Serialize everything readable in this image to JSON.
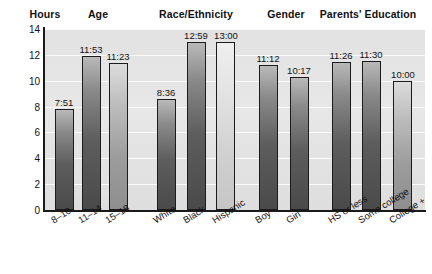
{
  "chart_data": {
    "type": "bar",
    "title": "",
    "xlabel": "",
    "ylabel": "Hours",
    "ylim": [
      0,
      14
    ],
    "yticks": [
      0,
      2,
      4,
      6,
      8,
      10,
      12,
      14
    ],
    "grid": true,
    "legend": null,
    "value_format": "h:mm",
    "groups": [
      {
        "name": "Age",
        "categories": [
          "8–10",
          "11–14",
          "15–18"
        ],
        "labels": [
          "7:51",
          "11:53",
          "11:23"
        ],
        "values": [
          7.85,
          11.88,
          11.38
        ],
        "tones": [
          "dark",
          "dark",
          "mid"
        ]
      },
      {
        "name": "Race/Ethnicity",
        "categories": [
          "White",
          "Black",
          "Hispanic"
        ],
        "labels": [
          "8:36",
          "12:59",
          "13:00"
        ],
        "values": [
          8.6,
          12.98,
          13.0
        ],
        "tones": [
          "dark",
          "dark",
          "light"
        ]
      },
      {
        "name": "Gender",
        "categories": [
          "Boy",
          "Girl"
        ],
        "labels": [
          "11:12",
          "10:17"
        ],
        "values": [
          11.2,
          10.28
        ],
        "tones": [
          "dark",
          "dark"
        ]
      },
      {
        "name": "Parents' Education",
        "categories": [
          "HS or less",
          "Some college",
          "College +"
        ],
        "labels": [
          "11:26",
          "11:30",
          "10:00"
        ],
        "values": [
          11.43,
          11.5,
          10.0
        ],
        "tones": [
          "dark",
          "dark",
          "mid"
        ]
      }
    ]
  },
  "headers": [
    {
      "label": "Hours",
      "x": 45
    },
    {
      "label": "Age",
      "x": 98
    },
    {
      "label": "Race/Ethnicity",
      "x": 196
    },
    {
      "label": "Gender",
      "x": 286
    },
    {
      "label": "Parents' Education",
      "x": 368
    }
  ],
  "bars": [
    {
      "name": "bar-age-8-10",
      "label": "7:51",
      "value": 7.85,
      "x": 55,
      "w": 19,
      "tone": "dark",
      "cat": "8–10",
      "cat_x": 49,
      "label_x": 64
    },
    {
      "name": "bar-age-11-14",
      "label": "11:53",
      "value": 11.88,
      "x": 82,
      "w": 19,
      "tone": "dark",
      "cat": "11–14",
      "cat_x": 76,
      "label_x": 91
    },
    {
      "name": "bar-age-15-18",
      "label": "11:23",
      "value": 11.38,
      "x": 109,
      "w": 19,
      "tone": "mid",
      "cat": "15–18",
      "cat_x": 103,
      "label_x": 118
    },
    {
      "name": "bar-race-white",
      "label": "8:36",
      "value": 8.6,
      "x": 157,
      "w": 19,
      "tone": "dark",
      "cat": "White",
      "cat_x": 151,
      "label_x": 166
    },
    {
      "name": "bar-race-black",
      "label": "12:59",
      "value": 12.98,
      "x": 187,
      "w": 19,
      "tone": "dark",
      "cat": "Black",
      "cat_x": 181,
      "label_x": 196
    },
    {
      "name": "bar-race-hispanic",
      "label": "13:00",
      "value": 13.0,
      "x": 216,
      "w": 19,
      "tone": "light",
      "cat": "Hispanic",
      "cat_x": 210,
      "label_x": 226
    },
    {
      "name": "bar-gender-boy",
      "label": "11:12",
      "value": 11.2,
      "x": 259,
      "w": 19,
      "tone": "dark",
      "cat": "Boy",
      "cat_x": 253,
      "label_x": 268
    },
    {
      "name": "bar-gender-girl",
      "label": "10:17",
      "value": 10.28,
      "x": 290,
      "w": 19,
      "tone": "dark",
      "cat": "Girl",
      "cat_x": 284,
      "label_x": 299
    },
    {
      "name": "bar-parents-hs",
      "label": "11:26",
      "value": 11.43,
      "x": 332,
      "w": 19,
      "tone": "dark",
      "cat": "HS or less",
      "cat_x": 326,
      "label_x": 341
    },
    {
      "name": "bar-parents-some",
      "label": "11:30",
      "value": 11.5,
      "x": 362,
      "w": 19,
      "tone": "dark",
      "cat": "Some college",
      "cat_x": 356,
      "label_x": 371
    },
    {
      "name": "bar-parents-college",
      "label": "10:00",
      "value": 10.0,
      "x": 393,
      "w": 19,
      "tone": "mid",
      "cat": "College +",
      "cat_x": 387,
      "label_x": 403
    }
  ]
}
